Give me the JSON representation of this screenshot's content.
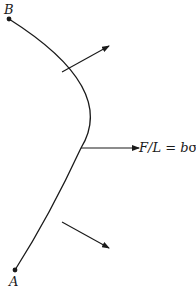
{
  "diagram": {
    "type": "curved membrane / surface segment with normal force arrows",
    "points": {
      "top": {
        "label": "B"
      },
      "bottom": {
        "label": "A"
      }
    },
    "force_label": {
      "lhs": "F/L",
      "equals": "=",
      "rhs_var": "b",
      "rhs_sym": "σ"
    },
    "arrows": [
      {
        "name": "upper-normal-arrow",
        "direction": "up-right"
      },
      {
        "name": "middle-normal-arrow",
        "direction": "right"
      },
      {
        "name": "lower-normal-arrow",
        "direction": "down-right"
      }
    ],
    "colors": {
      "stroke": "#1a1a1a",
      "background": "#ffffff"
    }
  }
}
